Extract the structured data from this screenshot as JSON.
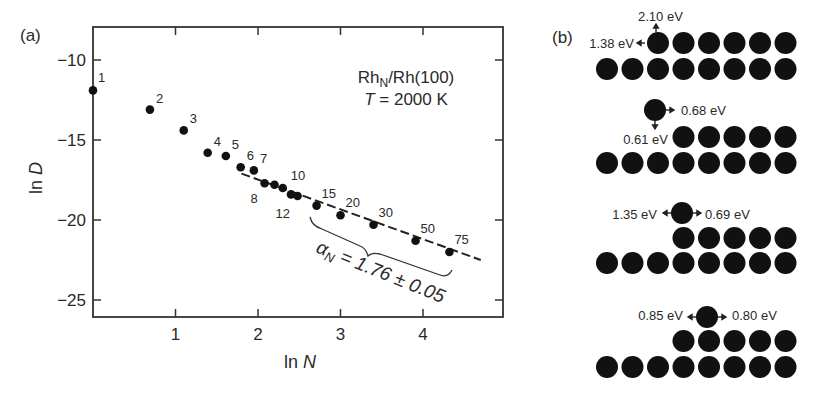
{
  "panel_a": {
    "label": "(a)",
    "system": "Rh",
    "system_sub": "N",
    "system_rest": "/Rh(100)",
    "temp_var": "T",
    "temp_value": " = 2000 K",
    "ylabel": "ln",
    "ylabel_var": "D",
    "xlabel": "ln",
    "xlabel_var": "N",
    "fit_label_var": "α",
    "fit_label_sub": "N",
    "fit_label_rest": " = 1.76 ± 0.05"
  },
  "panel_b": {
    "label": "(b)",
    "configs": [
      {
        "labels": [
          "2.10 eV",
          "1.38 eV"
        ]
      },
      {
        "labels": [
          "0.68 eV",
          "0.61 eV"
        ]
      },
      {
        "labels": [
          "1.35 eV",
          "0.69 eV"
        ]
      },
      {
        "labels": [
          "0.85 eV",
          "0.80 eV"
        ]
      }
    ]
  },
  "chart_data": {
    "type": "scatter",
    "xlabel": "ln N",
    "ylabel": "ln D",
    "xlim": [
      0,
      5
    ],
    "ylim": [
      -26,
      -8
    ],
    "xticks": [
      1,
      2,
      3,
      4
    ],
    "yticks": [
      -10,
      -15,
      -20,
      -25
    ],
    "grid": false,
    "points": [
      {
        "N": 1,
        "lnN": 0.0,
        "lnD": -11.9
      },
      {
        "N": 2,
        "lnN": 0.69,
        "lnD": -13.1
      },
      {
        "N": 3,
        "lnN": 1.1,
        "lnD": -14.4
      },
      {
        "N": 4,
        "lnN": 1.39,
        "lnD": -15.8
      },
      {
        "N": 5,
        "lnN": 1.61,
        "lnD": -16.0
      },
      {
        "N": 6,
        "lnN": 1.79,
        "lnD": -16.7
      },
      {
        "N": 7,
        "lnN": 1.95,
        "lnD": -16.9
      },
      {
        "N": 8,
        "lnN": 2.08,
        "lnD": -17.7
      },
      {
        "N": 9,
        "lnN": 2.2,
        "lnD": -17.8
      },
      {
        "N": 10,
        "lnN": 2.3,
        "lnD": -18.0
      },
      {
        "N": 11,
        "lnN": 2.4,
        "lnD": -18.4
      },
      {
        "N": 12,
        "lnN": 2.48,
        "lnD": -18.5
      },
      {
        "N": 15,
        "lnN": 2.71,
        "lnD": -19.1
      },
      {
        "N": 20,
        "lnN": 3.0,
        "lnD": -19.7
      },
      {
        "N": 30,
        "lnN": 3.4,
        "lnD": -20.3
      },
      {
        "N": 50,
        "lnN": 3.91,
        "lnD": -21.3
      },
      {
        "N": 75,
        "lnN": 4.32,
        "lnD": -22.0
      }
    ],
    "fit_line": {
      "x": [
        1.8,
        4.7
      ],
      "y": [
        -17.1,
        -22.5
      ],
      "style": "dashed",
      "slope_label": "αN = 1.76 ± 0.05"
    },
    "annotations": [
      "(a)",
      "RhN/Rh(100)",
      "T = 2000 K",
      "αN = 1.76 ± 0.05"
    ]
  }
}
